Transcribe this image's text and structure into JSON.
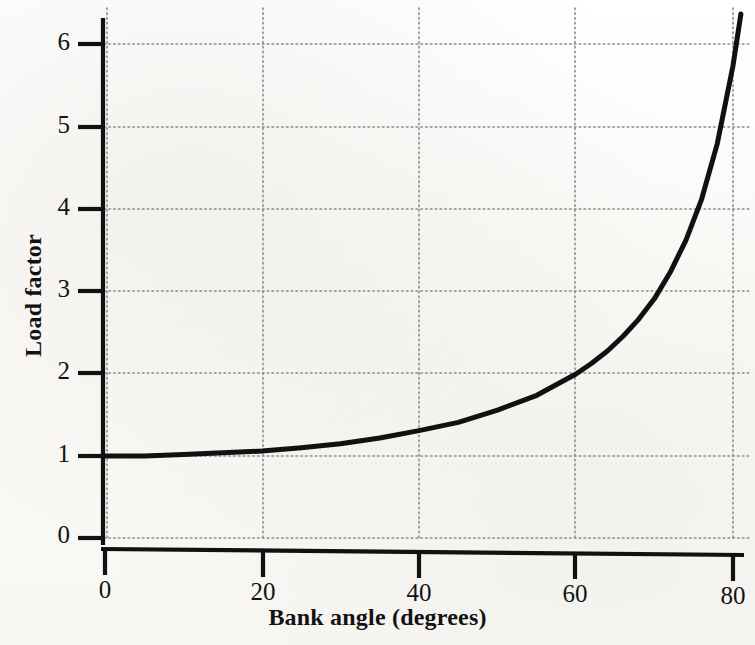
{
  "figure": {
    "background_color": "#fdfdfc",
    "ink_color": "#111111",
    "grid_color": "#9a9a9a"
  },
  "axes": {
    "x_label": "Bank angle (degrees)",
    "y_label": "Load factor",
    "x_ticks": [
      "0",
      "20",
      "40",
      "60",
      "80"
    ],
    "y_ticks": [
      "0",
      "1",
      "2",
      "3",
      "4",
      "5",
      "6"
    ]
  },
  "chart_data": {
    "type": "line",
    "title": "",
    "xlabel": "Bank angle (degrees)",
    "ylabel": "Load factor",
    "xlim": [
      0,
      83
    ],
    "ylim": [
      0,
      6.3
    ],
    "xticks": [
      0,
      20,
      40,
      60,
      80
    ],
    "yticks": [
      0,
      1,
      2,
      3,
      4,
      5,
      6
    ],
    "grid": true,
    "legend": "none",
    "relationship": "load factor = 1 / cos(bank angle)",
    "series": [
      {
        "name": "Load factor",
        "color": "#111111",
        "line_width": 5,
        "x": [
          0,
          5,
          10,
          15,
          20,
          25,
          30,
          35,
          40,
          45,
          50,
          55,
          60,
          62,
          64,
          66,
          68,
          70,
          72,
          74,
          76,
          78,
          80,
          81,
          82,
          83
        ],
        "y": [
          1.0,
          1.0,
          1.02,
          1.04,
          1.06,
          1.1,
          1.15,
          1.22,
          1.31,
          1.41,
          1.56,
          1.74,
          2.0,
          2.13,
          2.28,
          2.46,
          2.67,
          2.92,
          3.24,
          3.63,
          4.13,
          4.81,
          5.76,
          6.39,
          7.19,
          8.21
        ]
      }
    ]
  }
}
